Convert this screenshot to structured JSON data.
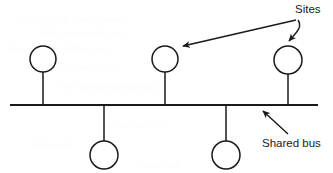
{
  "diagram": {
    "background_color": "#ffffff",
    "line_color": "#1a1a1a",
    "bus": {
      "label": "Shared bus",
      "x1": 10,
      "y1": 105,
      "x2": 318,
      "y2": 105
    },
    "nodes": [
      {
        "id": "site-1",
        "position": "above",
        "cx": 43,
        "cy": 59,
        "r": 13,
        "stem_to_y": 105
      },
      {
        "id": "site-2",
        "position": "below",
        "cx": 104,
        "cy": 155,
        "r": 14,
        "stem_to_y": 105
      },
      {
        "id": "site-3",
        "position": "above",
        "cx": 165,
        "cy": 59,
        "r": 13,
        "stem_to_y": 105
      },
      {
        "id": "site-4",
        "position": "below",
        "cx": 226,
        "cy": 155,
        "r": 14,
        "stem_to_y": 105
      },
      {
        "id": "site-5",
        "position": "above",
        "cx": 288,
        "cy": 60,
        "r": 14,
        "stem_to_y": 105
      }
    ],
    "node_count": 5,
    "labels": {
      "sites": "Sites",
      "shared_bus": "Shared bus"
    },
    "annotations": [
      {
        "id": "sites-leader-left",
        "label": "Sites",
        "from": {
          "x": 296,
          "y": 20
        },
        "to": {
          "x": 179,
          "y": 47
        },
        "points_to": "site-3"
      },
      {
        "id": "sites-leader-right",
        "label": "Sites",
        "from": {
          "x": 298,
          "y": 20
        },
        "to": {
          "x": 289,
          "y": 44
        },
        "points_to": "site-5"
      },
      {
        "id": "shared-bus-leader",
        "label": "Shared bus",
        "from": {
          "x": 288,
          "y": 134
        },
        "to": {
          "x": 261,
          "y": 109
        },
        "points_to": "bus"
      }
    ],
    "label_positions": {
      "sites": {
        "x": 295,
        "y": 13
      },
      "shared_bus": {
        "x": 262,
        "y": 147
      }
    }
  },
  "background_bleed": [
    {
      "text": "scanned page bleed-through",
      "x": 14,
      "y": 14
    },
    {
      "text": "faint reverse side text",
      "x": 40,
      "y": 28
    },
    {
      "text": "barely visible artifact row",
      "x": 8,
      "y": 44
    },
    {
      "text": "residual ink from verso",
      "x": 24,
      "y": 62
    },
    {
      "text": "low contrast background",
      "x": 60,
      "y": 82
    },
    {
      "text": "scan artifact line",
      "x": 100,
      "y": 120
    },
    {
      "text": "faint marks",
      "x": 30,
      "y": 140
    },
    {
      "text": "bleed text",
      "x": 140,
      "y": 160
    }
  ]
}
